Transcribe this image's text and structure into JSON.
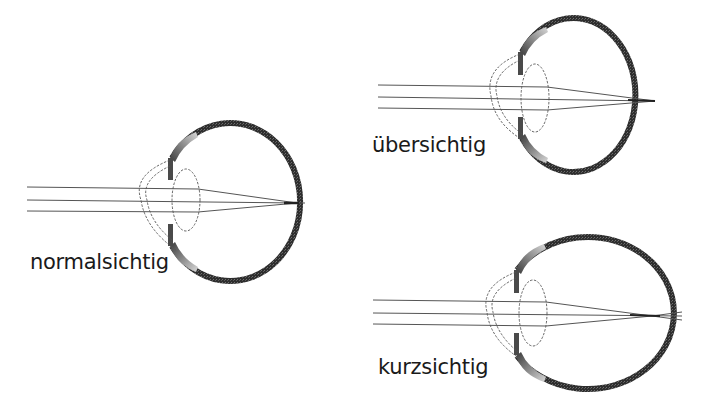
{
  "diagram": {
    "title": "",
    "colors": {
      "background": "#ffffff",
      "sclera": "#3a3a3a",
      "iris_gradient_light": "#c8c8c8",
      "ray": "#555555",
      "dashed_outline": "#555555",
      "text": "#1a1a1a"
    },
    "eyes": [
      {
        "id": "normal",
        "label": "normalsichtig",
        "description": "Rays focus exactly on the retina"
      },
      {
        "id": "farsighted",
        "label": "übersichtig",
        "description": "Shortened eyeball – focus lies behind the retina"
      },
      {
        "id": "nearsighted",
        "label": "kurzsichtig",
        "description": "Elongated eyeball – focus lies in front of the retina"
      }
    ]
  }
}
